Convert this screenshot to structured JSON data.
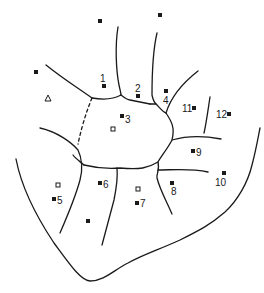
{
  "diagram": {
    "type": "region-map",
    "stroke_color": "#1a1a1a",
    "background": "#ffffff",
    "regions": [
      {
        "id": "1",
        "label": "1",
        "marker": "filled-square",
        "x": 104,
        "y": 86,
        "label_x": 100,
        "label_y": 82
      },
      {
        "id": "2",
        "label": "2",
        "marker": "filled-square",
        "x": 138,
        "y": 96,
        "label_x": 135,
        "label_y": 92
      },
      {
        "id": "3",
        "label": "3",
        "marker": "filled-square",
        "x": 122,
        "y": 116,
        "label_x": 126,
        "label_y": 122
      },
      {
        "id": "4",
        "label": "4",
        "marker": "filled-square",
        "x": 166,
        "y": 91,
        "label_x": 163,
        "label_y": 104
      },
      {
        "id": "5",
        "label": "5",
        "marker": "filled-square",
        "x": 54,
        "y": 199,
        "label_x": 58,
        "label_y": 203
      },
      {
        "id": "6",
        "label": "6",
        "marker": "filled-square",
        "x": 100,
        "y": 183,
        "label_x": 104,
        "label_y": 188
      },
      {
        "id": "7",
        "label": "7",
        "marker": "filled-square",
        "x": 137,
        "y": 203,
        "label_x": 141,
        "label_y": 207
      },
      {
        "id": "8",
        "label": "8",
        "marker": "filled-square",
        "x": 172,
        "y": 183,
        "label_x": 172,
        "label_y": 195
      },
      {
        "id": "9",
        "label": "9",
        "marker": "filled-square",
        "x": 193,
        "y": 151,
        "label_x": 197,
        "label_y": 156
      },
      {
        "id": "10",
        "label": "10",
        "marker": "filled-square",
        "x": 224,
        "y": 173,
        "label_x": 216,
        "label_y": 185
      },
      {
        "id": "11",
        "label": "11",
        "marker": "filled-square",
        "x": 194,
        "y": 108,
        "label_x": 183,
        "label_y": 112
      },
      {
        "id": "12",
        "label": "12",
        "marker": "filled-square",
        "x": 229,
        "y": 114,
        "label_x": 217,
        "label_y": 118
      }
    ],
    "unlabeled_markers": [
      {
        "marker": "filled-square",
        "x": 100,
        "y": 21
      },
      {
        "marker": "filled-square",
        "x": 160,
        "y": 15
      },
      {
        "marker": "filled-square",
        "x": 36,
        "y": 72
      },
      {
        "marker": "filled-square",
        "x": 88,
        "y": 221
      },
      {
        "marker": "open-triangle",
        "x": 48,
        "y": 98
      },
      {
        "marker": "open-square",
        "x": 113,
        "y": 129
      },
      {
        "marker": "open-square",
        "x": 58,
        "y": 185
      },
      {
        "marker": "open-square",
        "x": 138,
        "y": 189
      }
    ]
  }
}
